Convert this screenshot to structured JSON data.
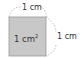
{
  "diagram": {
    "square": {
      "fill": "#c8c8c8",
      "stroke": "#9a9a9a"
    },
    "area_label": {
      "value": "1 cm",
      "superscript": "2"
    },
    "top_side_label": "1 cm",
    "right_side_label": "1 cm"
  }
}
